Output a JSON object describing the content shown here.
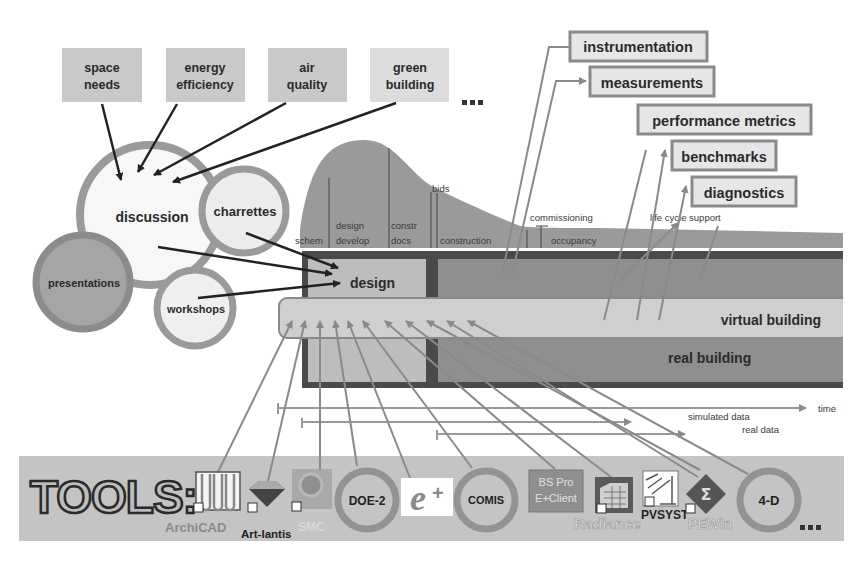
{
  "topics": [
    {
      "label_line1": "space",
      "label_line2": "needs"
    },
    {
      "label_line1": "energy",
      "label_line2": "efficiency"
    },
    {
      "label_line1": "air",
      "label_line2": "quality"
    },
    {
      "label_line1": "green",
      "label_line2": "building"
    }
  ],
  "topics_ellipsis": "...",
  "bubbles": {
    "discussion": "discussion",
    "charrettes": "charrettes",
    "presentations": "presentations",
    "workshops": "workshops"
  },
  "phases": {
    "schem": "schem",
    "design_develop_1": "design",
    "design_develop_2": "develop",
    "constr_docs_1": "constr",
    "constr_docs_2": "docs",
    "bids": "bids",
    "construction": "construction",
    "commissioning": "commissioning",
    "occupancy": "occupancy",
    "life_cycle_support": "life cycle support"
  },
  "blocks": {
    "design": "design",
    "virtual_building": "virtual building",
    "real_building": "real building"
  },
  "outputs": [
    "instrumentation",
    "measurements",
    "performance metrics",
    "benchmarks",
    "diagnostics"
  ],
  "timelines": {
    "time": "time",
    "simulated_data": "simulated data",
    "real_data": "real data"
  },
  "tools_bar": {
    "title": "TOOLS:",
    "items": [
      {
        "name": "ArchiCAD"
      },
      {
        "name": "Art-lantis"
      },
      {
        "name": "SMC"
      },
      {
        "name": "DOE-2"
      },
      {
        "name": "EnergyPlus",
        "glyph": "e+"
      },
      {
        "name": "COMIS"
      },
      {
        "name": "BS Pro",
        "name2": "E+Client"
      },
      {
        "name": "Radiance"
      },
      {
        "name": "PVSYST"
      },
      {
        "name": "PEWin",
        "glyph": "Σ"
      },
      {
        "name": "4-D"
      }
    ],
    "ellipsis": "..."
  },
  "colors": {
    "box_fill": "#c9c9c9",
    "ring": "#9a9a9a",
    "band_dark": "#4a4a4a",
    "band_mid": "#8f8f8f",
    "band_light": "#cfcfcf",
    "arrow_gray": "#8a8a8a",
    "arrow_dark": "#222222"
  }
}
